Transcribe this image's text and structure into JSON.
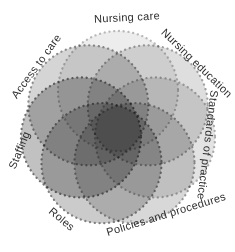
{
  "figure": {
    "background": "#ffffff",
    "label_color": "#2e2e2e"
  },
  "diagram": {
    "type": "venn-flower",
    "center_x": 118,
    "center_y": 129,
    "circle_radius": 60,
    "center_offset": 38,
    "circles": [
      {
        "label": "Nursing care",
        "angle_deg": -90,
        "fill": "#ededed",
        "stroke": "#b8b8b8",
        "label_x": 127,
        "label_y": 17,
        "label_rotate": -3
      },
      {
        "label": "Nursing education",
        "angle_deg": -38.57,
        "fill": "#dedede",
        "stroke": "#a0a0a0",
        "label_x": 197,
        "label_y": 63,
        "label_rotate": 44
      },
      {
        "label": "Standards of practice",
        "angle_deg": 12.86,
        "fill": "#e3e3e3",
        "stroke": "#ababab",
        "label_x": 208,
        "label_y": 145,
        "label_rotate": 97
      },
      {
        "label": "Policies and procedures",
        "angle_deg": 64.29,
        "fill": "#d8d8d8",
        "stroke": "#969696",
        "label_x": 166,
        "label_y": 214,
        "label_rotate": -17
      },
      {
        "label": "Roles",
        "angle_deg": 115.71,
        "fill": "#cbcbcb",
        "stroke": "#808080",
        "label_x": 62,
        "label_y": 219,
        "label_rotate": 40
      },
      {
        "label": "Staffing",
        "angle_deg": 167.14,
        "fill": "#c1c1c1",
        "stroke": "#727272",
        "label_x": 19,
        "label_y": 150,
        "label_rotate": -68
      },
      {
        "label": "Access to care",
        "angle_deg": -141.43,
        "fill": "#d5d5d5",
        "stroke": "#8e8e8e",
        "label_x": 36,
        "label_y": 66,
        "label_rotate": -54
      }
    ]
  }
}
